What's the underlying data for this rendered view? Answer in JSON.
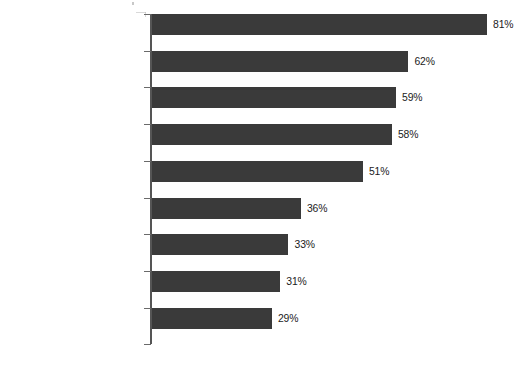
{
  "chart_data": {
    "type": "bar",
    "orientation": "horizontal",
    "title": "",
    "subtitle": "",
    "xlabel": "",
    "ylabel": "",
    "grid": false,
    "legend": null,
    "value_suffix": "%",
    "xlim": [
      0,
      81
    ],
    "axis": {
      "value_axis": "x",
      "category_axis": "y",
      "tick_labels": [],
      "axis_line_visible": true,
      "category_ticks_visible": true
    },
    "colors": {
      "bar": "#3a3a3a",
      "axis": "#555555",
      "tick": "#6a6a6a",
      "text": "#1b1b1b",
      "background": "#ffffff"
    },
    "categories": [
      "Read posts from people\nknown personally",
      "Posted status update",
      "Read posts from\norganizations/brands/events",
      "Followed posted link\nto website",
      "Read posts from public\nfigures/celebrities",
      "Posted link to website",
      "Received coupon/offer/deal",
      "Used social networking\ncheck-in service",
      "Clicked on advertisement"
    ],
    "values": [
      81,
      62,
      59,
      58,
      51,
      36,
      33,
      31,
      29
    ],
    "data_labels": [
      "81%",
      "62%",
      "59%",
      "58%",
      "51%",
      "36%",
      "33%",
      "31%",
      "29%"
    ]
  },
  "rows": [
    {
      "label": "Read posts from people\nknown personally",
      "value": 81,
      "value_label": "81%"
    },
    {
      "label": "Posted status update",
      "value": 62,
      "value_label": "62%"
    },
    {
      "label": "Read posts from\norganizations/brands/events",
      "value": 59,
      "value_label": "59%"
    },
    {
      "label": "Followed posted link\nto website",
      "value": 58,
      "value_label": "58%"
    },
    {
      "label": "Read posts from public\nfigures/celebrities",
      "value": 51,
      "value_label": "51%"
    },
    {
      "label": "Posted link to website",
      "value": 36,
      "value_label": "36%"
    },
    {
      "label": "Received coupon/offer/deal",
      "value": 33,
      "value_label": "33%"
    },
    {
      "label": "Used social networking\ncheck-in service",
      "value": 31,
      "value_label": "31%"
    },
    {
      "label": "Clicked on advertisement",
      "value": 29,
      "value_label": "29%"
    }
  ]
}
